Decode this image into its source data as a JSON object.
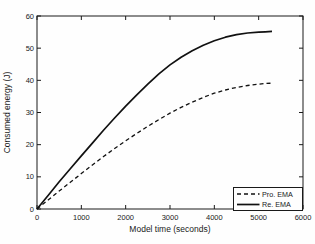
{
  "figure": {
    "background": "#fefefe",
    "axis_color": "#1a1a1a",
    "text_color": "#1a1a1a"
  },
  "chart_data": {
    "type": "line",
    "title": "",
    "xlabel": "Model time (seconds)",
    "ylabel": "Consumed energy (J)",
    "xlim": [
      0,
      6000
    ],
    "ylim": [
      0,
      60
    ],
    "xticks": [
      "0",
      "1000",
      "2000",
      "3000",
      "4000",
      "5000",
      "6000"
    ],
    "xtick_values": [
      0,
      1000,
      2000,
      3000,
      4000,
      5000,
      6000
    ],
    "yticks": [
      "0",
      "10",
      "20",
      "30",
      "40",
      "50",
      "60"
    ],
    "ytick_values": [
      0,
      10,
      20,
      30,
      40,
      50,
      60
    ],
    "grid": false,
    "legend": {
      "position": "bottom-right",
      "entries": [
        {
          "label": "Pro. EMA",
          "style": "dashed"
        },
        {
          "label": "Re. EMA",
          "style": "solid"
        }
      ]
    },
    "series": [
      {
        "name": "Pro. EMA",
        "style": "dashed",
        "color": "#111111",
        "x": [
          0,
          250,
          500,
          750,
          1000,
          1250,
          1500,
          1750,
          2000,
          2250,
          2500,
          2750,
          3000,
          3250,
          3500,
          3750,
          4000,
          4250,
          4500,
          4750,
          5000,
          5150,
          5300
        ],
        "y": [
          0,
          2.8,
          5.6,
          8.3,
          11,
          13.7,
          16.3,
          18.8,
          21.2,
          23.5,
          25.7,
          27.8,
          29.8,
          31.6,
          33.2,
          34.7,
          36,
          37,
          37.8,
          38.4,
          38.8,
          39,
          39.1
        ]
      },
      {
        "name": "Re. EMA",
        "style": "solid",
        "color": "#111111",
        "x": [
          0,
          250,
          500,
          750,
          1000,
          1250,
          1500,
          1750,
          2000,
          2250,
          2500,
          2750,
          3000,
          3250,
          3500,
          3750,
          4000,
          4250,
          4500,
          4750,
          5000,
          5150,
          5300
        ],
        "y": [
          0,
          4.2,
          8.5,
          12.5,
          16.5,
          20.5,
          24.5,
          28.3,
          32,
          35.5,
          38.8,
          42,
          44.8,
          47.2,
          49.2,
          50.9,
          52.3,
          53.4,
          54.2,
          54.7,
          55,
          55.1,
          55.2
        ]
      }
    ]
  }
}
